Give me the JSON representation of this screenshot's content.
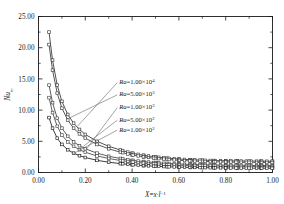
{
  "chart_data": {
    "type": "line",
    "title": "",
    "xlabel": "X = x·l⁻¹",
    "ylabel": "Nuₘ",
    "xlim": [
      0.0,
      1.0
    ],
    "ylim": [
      0.0,
      25.0
    ],
    "xticks": [
      "0.00",
      "0.20",
      "0.40",
      "0.60",
      "0.80",
      "1.00"
    ],
    "xtick_values": [
      0.0,
      0.2,
      0.4,
      0.6,
      0.8,
      1.0
    ],
    "yticks": [
      "0.00",
      "5.00",
      "10.00",
      "15.00",
      "20.00",
      "25.00"
    ],
    "ytick_values": [
      0.0,
      5.0,
      10.0,
      15.0,
      20.0,
      25.0
    ],
    "grid": false,
    "legend_position": "inside-center",
    "marker": "square",
    "series": [
      {
        "name": "Ra=1.00×10⁴",
        "label_prefix": "Ra",
        "label_mantissa": "1.00",
        "label_exponent": "4",
        "color": "#333333",
        "x": [
          0.045,
          0.06,
          0.08,
          0.1,
          0.125,
          0.15,
          0.175,
          0.2,
          0.25,
          0.3,
          0.35,
          0.4,
          0.45,
          0.5,
          0.55,
          0.6,
          0.65,
          0.7,
          0.75,
          0.8,
          0.85,
          0.9,
          0.95,
          1.0
        ],
        "y": [
          22.5,
          18.0,
          14.0,
          11.4,
          9.3,
          7.9,
          6.9,
          6.1,
          5.0,
          4.2,
          3.6,
          3.1,
          2.75,
          2.5,
          2.3,
          2.15,
          2.05,
          1.98,
          1.92,
          1.88,
          1.85,
          1.83,
          1.82,
          1.8
        ]
      },
      {
        "name": "Ra=5.00×10³",
        "label_prefix": "Ra",
        "label_mantissa": "5.00",
        "label_exponent": "3",
        "color": "#3a3a3a",
        "x": [
          0.045,
          0.06,
          0.08,
          0.1,
          0.125,
          0.15,
          0.175,
          0.2,
          0.25,
          0.3,
          0.35,
          0.4,
          0.45,
          0.5,
          0.55,
          0.6,
          0.65,
          0.7,
          0.75,
          0.8,
          0.85,
          0.9,
          0.95,
          1.0
        ],
        "y": [
          20.5,
          16.4,
          12.7,
          10.3,
          8.4,
          7.1,
          6.2,
          5.5,
          4.5,
          3.8,
          3.25,
          2.8,
          2.5,
          2.25,
          2.1,
          1.95,
          1.85,
          1.78,
          1.72,
          1.68,
          1.65,
          1.63,
          1.62,
          1.6
        ]
      },
      {
        "name": "Ra=1.00×10³",
        "label_prefix": "Ra",
        "label_mantissa": "1.00",
        "label_exponent": "3",
        "color": "#404040",
        "x": [
          0.045,
          0.06,
          0.08,
          0.1,
          0.125,
          0.15,
          0.175,
          0.2,
          0.25,
          0.3,
          0.35,
          0.4,
          0.45,
          0.5,
          0.55,
          0.6,
          0.65,
          0.7,
          0.75,
          0.8,
          0.85,
          0.9,
          0.95,
          1.0
        ],
        "y": [
          14.0,
          11.2,
          8.7,
          7.1,
          5.8,
          4.9,
          4.3,
          3.8,
          3.1,
          2.6,
          2.25,
          1.95,
          1.75,
          1.58,
          1.45,
          1.36,
          1.29,
          1.24,
          1.2,
          1.17,
          1.15,
          1.13,
          1.12,
          1.1
        ]
      },
      {
        "name": "Ra=5.00×10²",
        "label_prefix": "Ra",
        "label_mantissa": "5.00",
        "label_exponent": "2",
        "color": "#454545",
        "x": [
          0.045,
          0.06,
          0.08,
          0.1,
          0.125,
          0.15,
          0.175,
          0.2,
          0.25,
          0.3,
          0.35,
          0.4,
          0.45,
          0.5,
          0.55,
          0.6,
          0.65,
          0.7,
          0.75,
          0.8,
          0.85,
          0.9,
          0.95,
          1.0
        ],
        "y": [
          12.0,
          9.6,
          7.4,
          6.0,
          4.9,
          4.2,
          3.65,
          3.25,
          2.65,
          2.25,
          1.92,
          1.68,
          1.5,
          1.36,
          1.25,
          1.17,
          1.11,
          1.07,
          1.03,
          1.01,
          0.99,
          0.97,
          0.96,
          0.95
        ]
      },
      {
        "name": "Ra=1.00×10²",
        "label_prefix": "Ra",
        "label_mantissa": "1.00",
        "label_exponent": "2",
        "color": "#1a1a1a",
        "x": [
          0.045,
          0.06,
          0.08,
          0.1,
          0.125,
          0.15,
          0.175,
          0.2,
          0.25,
          0.3,
          0.35,
          0.4,
          0.45,
          0.5,
          0.55,
          0.6,
          0.65,
          0.7,
          0.75,
          0.8,
          0.85,
          0.9,
          0.95,
          1.0
        ],
        "y": [
          8.8,
          7.1,
          5.5,
          4.5,
          3.65,
          3.1,
          2.7,
          2.4,
          1.95,
          1.65,
          1.42,
          1.24,
          1.1,
          1.0,
          0.92,
          0.86,
          0.81,
          0.78,
          0.75,
          0.73,
          0.71,
          0.7,
          0.69,
          0.68
        ]
      }
    ],
    "annotations": [
      {
        "series_index": 0,
        "text_x": 0.345,
        "text_y": 14.55,
        "anchor_x": 0.165,
        "anchor_y": 7.35
      },
      {
        "series_index": 1,
        "text_x": 0.345,
        "text_y": 12.6,
        "anchor_x": 0.122,
        "anchor_y": 8.55
      },
      {
        "series_index": 2,
        "text_x": 0.345,
        "text_y": 10.55,
        "anchor_x": 0.205,
        "anchor_y": 3.75
      },
      {
        "series_index": 3,
        "text_x": 0.345,
        "text_y": 8.55,
        "anchor_x": 0.175,
        "anchor_y": 3.7
      },
      {
        "series_index": 4,
        "text_x": 0.345,
        "text_y": 6.95,
        "anchor_x": 0.15,
        "anchor_y": 3.05
      }
    ]
  }
}
